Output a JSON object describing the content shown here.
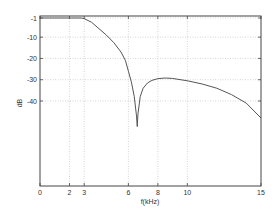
{
  "chart_data": {
    "type": "line",
    "title": "",
    "xlabel": "f(kHz)",
    "ylabel": "dB",
    "xlim": [
      0,
      15
    ],
    "ylim": [
      -1,
      -40
    ],
    "grid": true,
    "legend": null,
    "x_ticks": [
      0,
      2,
      3,
      6,
      8,
      10,
      15
    ],
    "x_tick_labels": [
      "0",
      "2",
      "3",
      "6",
      "8",
      "10",
      "15"
    ],
    "y_ticks": [
      -1,
      -10,
      -20,
      -30,
      -40
    ],
    "y_tick_labels": [
      "-1",
      "-10",
      "-20",
      "-30",
      "-40"
    ],
    "series": [
      {
        "name": "magnitude response",
        "color": "#555555",
        "x": [
          0,
          1,
          2,
          2.8,
          3.0,
          3.5,
          4.0,
          4.5,
          5.0,
          5.5,
          5.8,
          6.0,
          6.2,
          6.4,
          6.55,
          6.6,
          6.65,
          6.8,
          7.0,
          7.3,
          7.6,
          8.0,
          8.5,
          9.0,
          10.0,
          11.0,
          12.0,
          13.0,
          14.0,
          15.0
        ],
        "y": [
          -1,
          -1,
          -1,
          -1,
          -1.3,
          -3,
          -6,
          -9,
          -12.5,
          -17,
          -21,
          -26,
          -31,
          -38,
          -47,
          -52,
          -46,
          -38,
          -34,
          -31.5,
          -30.3,
          -29.5,
          -29.2,
          -29.4,
          -30.5,
          -32,
          -34,
          -37,
          -41,
          -48
        ]
      }
    ]
  },
  "colors": {
    "axis": "#444444",
    "grid": "#bbbbbb",
    "line": "#555555",
    "background": "#ffffff"
  }
}
